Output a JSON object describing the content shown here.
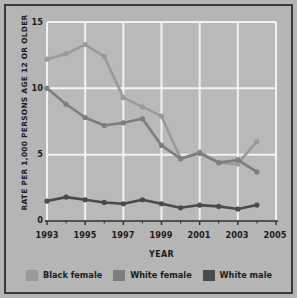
{
  "chart_data": {
    "type": "line",
    "title": "",
    "xlabel": "YEAR",
    "ylabel": "RATE PER 1,000 PERSONS AGE 12 OR OLDER",
    "x": [
      1993,
      1994,
      1995,
      1996,
      1997,
      1998,
      1999,
      2000,
      2001,
      2002,
      2003,
      2004
    ],
    "xlim": [
      1993,
      2005
    ],
    "ylim": [
      0,
      15
    ],
    "xticks": [
      "1993",
      "1995",
      "1997",
      "1999",
      "2001",
      "2003",
      "2005"
    ],
    "xtick_values": [
      1993,
      1995,
      1997,
      1999,
      2001,
      2003,
      2005
    ],
    "yticks": [
      "0",
      "5",
      "10",
      "15"
    ],
    "ytick_values": [
      0,
      5,
      10,
      15
    ],
    "grid": "white gridlines on x and y, plot background light gray",
    "legend_position": "below-plot",
    "series": [
      {
        "name": "Black female",
        "color": "#9a9a9a",
        "values": [
          12.2,
          12.6,
          13.3,
          12.4,
          9.3,
          8.6,
          7.9,
          4.7,
          5.2,
          4.4,
          4.3,
          6.0
        ]
      },
      {
        "name": "White female",
        "color": "#7d7d7d",
        "values": [
          10.0,
          8.8,
          7.8,
          7.2,
          7.4,
          7.7,
          5.7,
          4.7,
          5.1,
          4.4,
          4.6,
          3.7
        ]
      },
      {
        "name": "White male",
        "color": "#4a4a4a",
        "values": [
          1.5,
          1.8,
          1.6,
          1.4,
          1.3,
          1.6,
          1.3,
          1.0,
          1.2,
          1.1,
          0.9,
          1.2
        ]
      }
    ]
  },
  "legend": {
    "items": [
      {
        "label": "Black female",
        "color": "#9a9a9a"
      },
      {
        "label": "White female",
        "color": "#7d7d7d"
      },
      {
        "label": "White male",
        "color": "#4a4a4a"
      }
    ]
  },
  "axes": {
    "y_title": "RATE PER 1,000 PERSONS AGE 12 OR OLDER",
    "x_title": "YEAR"
  },
  "colors": {
    "figure_background": "#b5b5b5",
    "plot_background": "#b9b9b9",
    "gridline": "#f2f2f2",
    "axis_line": "#2e2e2e",
    "text": "#1c1c1c",
    "frame": "#3a3a3a"
  }
}
